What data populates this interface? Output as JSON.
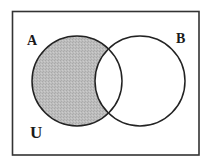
{
  "diagram": {
    "type": "venn",
    "universe_label": "U",
    "sets": [
      {
        "id": "A",
        "label": "A",
        "shaded": true
      },
      {
        "id": "B",
        "label": "B",
        "shaded": false
      }
    ],
    "shaded_region": "A minus B",
    "shaded_region_description": "Elements in A but not in B (A − B)",
    "colors": {
      "outline": "#222222",
      "shade": "#b9b9b9",
      "background": "#ffffff"
    }
  }
}
